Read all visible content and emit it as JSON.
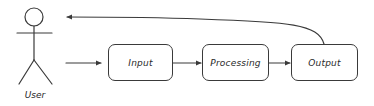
{
  "diagram": {
    "type": "flowchart",
    "actor": {
      "label": "User",
      "icon": "stick-figure-icon"
    },
    "nodes": [
      {
        "id": "input",
        "label": "Input"
      },
      {
        "id": "processing",
        "label": "Processing"
      },
      {
        "id": "output",
        "label": "Output"
      }
    ],
    "edges": [
      {
        "from": "User",
        "to": "Input"
      },
      {
        "from": "Input",
        "to": "Processing"
      },
      {
        "from": "Processing",
        "to": "Output"
      },
      {
        "from": "Output",
        "to": "User"
      }
    ],
    "colors": {
      "stroke": "#3a3a3a",
      "text": "#2a2a2a",
      "background": "#ffffff"
    }
  }
}
